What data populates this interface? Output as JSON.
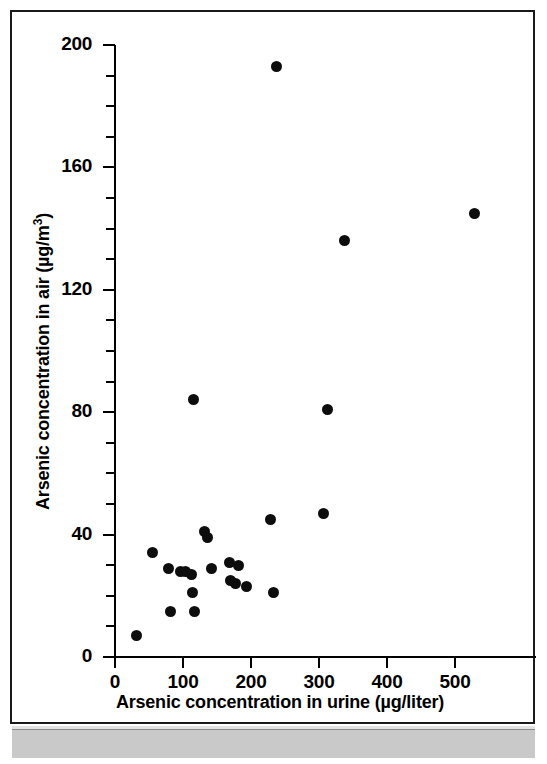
{
  "figure": {
    "axis_titles": {
      "x": "Arsenic concentration in urine (µg/liter)",
      "y_prefix": "Arsenic concentration in air (µg/m",
      "y_superscript": "3",
      "y_suffix": ")"
    }
  },
  "chart_data": {
    "type": "scatter",
    "title": "",
    "xlabel": "Arsenic concentration in urine (µg/liter)",
    "ylabel": "Arsenic concentration in air (µg/m3)",
    "xlim": [
      0,
      560
    ],
    "ylim": [
      0,
      200
    ],
    "xticks": [
      0,
      100,
      200,
      300,
      400,
      500
    ],
    "xticklabels": [
      "0",
      "100",
      "200",
      "300",
      "400",
      "500"
    ],
    "yticks": [
      0,
      40,
      80,
      120,
      160,
      200
    ],
    "yticklabels": [
      "0",
      "40",
      "80",
      "120",
      "160",
      "200"
    ],
    "y_minor_tick_step": 10,
    "grid": false,
    "legend": null,
    "marker": "filled-circle",
    "marker_color": "#0d0d0d",
    "points": [
      {
        "x": 31,
        "y": 7
      },
      {
        "x": 55,
        "y": 34
      },
      {
        "x": 79,
        "y": 29
      },
      {
        "x": 81,
        "y": 15
      },
      {
        "x": 97,
        "y": 28
      },
      {
        "x": 103,
        "y": 28
      },
      {
        "x": 112,
        "y": 27
      },
      {
        "x": 114,
        "y": 21
      },
      {
        "x": 116,
        "y": 84
      },
      {
        "x": 117,
        "y": 15
      },
      {
        "x": 132,
        "y": 41
      },
      {
        "x": 136,
        "y": 39
      },
      {
        "x": 142,
        "y": 29
      },
      {
        "x": 168,
        "y": 31
      },
      {
        "x": 170,
        "y": 25
      },
      {
        "x": 177,
        "y": 24
      },
      {
        "x": 182,
        "y": 30
      },
      {
        "x": 194,
        "y": 23
      },
      {
        "x": 228,
        "y": 45
      },
      {
        "x": 233,
        "y": 21
      },
      {
        "x": 238,
        "y": 193
      },
      {
        "x": 306,
        "y": 47
      },
      {
        "x": 313,
        "y": 81
      },
      {
        "x": 338,
        "y": 136
      },
      {
        "x": 528,
        "y": 145
      }
    ]
  },
  "axis": {
    "y_major_labels": [
      "0",
      "40",
      "80",
      "120",
      "160",
      "200"
    ],
    "x_major_labels": [
      "0",
      "100",
      "200",
      "300",
      "400",
      "500"
    ]
  }
}
